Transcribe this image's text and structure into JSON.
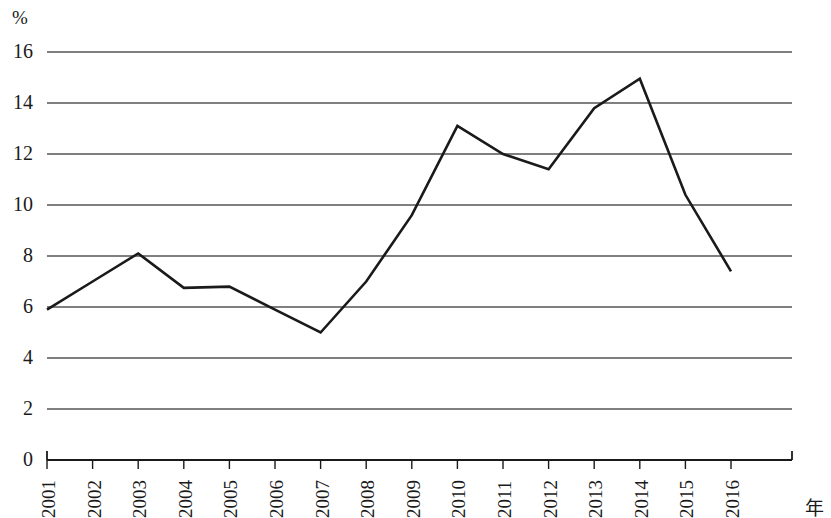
{
  "chart_data": {
    "type": "line",
    "title": "",
    "subtitle": "",
    "xlabel": "年",
    "ylabel": "%",
    "categories": [
      "2001",
      "2002",
      "2003",
      "2004",
      "2005",
      "2006",
      "2007",
      "2008",
      "2009",
      "2010",
      "2011",
      "2012",
      "2013",
      "2014",
      "2015",
      "2016"
    ],
    "values": [
      5.9,
      7.0,
      8.1,
      6.75,
      6.8,
      5.9,
      5.0,
      7.0,
      9.6,
      13.1,
      12.0,
      11.4,
      13.8,
      14.95,
      10.4,
      7.4
    ],
    "series": [
      {
        "name": "",
        "values": [
          5.9,
          7.0,
          8.1,
          6.75,
          6.8,
          5.9,
          5.0,
          7.0,
          9.6,
          13.1,
          12.0,
          11.4,
          13.8,
          14.95,
          10.4,
          7.4
        ],
        "color": "#1a1a1a"
      }
    ],
    "ylim": [
      0,
      16
    ],
    "yticks": [
      0,
      2,
      4,
      6,
      8,
      10,
      12,
      14,
      16
    ],
    "ytick_labels": [
      "0",
      "2",
      "4",
      "6",
      "8",
      "10",
      "12",
      "14",
      "16"
    ],
    "grid": true,
    "grid_axis": "y",
    "grid_color": "#555555",
    "legend": "none",
    "line_color": "#1a1a1a",
    "line_width": 2.6,
    "markers": "none",
    "axis_color": "#1a1a1a",
    "plot_background": "#ffffff"
  },
  "labels": {
    "y_unit": "%",
    "x_unit": "年"
  }
}
